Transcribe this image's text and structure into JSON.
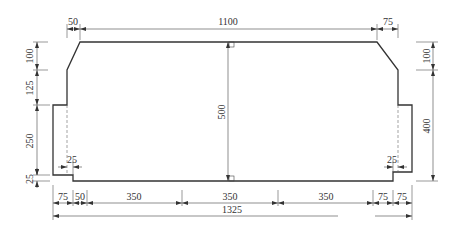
{
  "drawing": {
    "title": "Cross-section dimension drawing",
    "units": "mm",
    "top_dimensions": {
      "left_offset": "50",
      "top_width": "1100",
      "right_offset": "75"
    },
    "left_dimensions": {
      "upper_slope_height": "100",
      "middle_height": "125",
      "lower_height": "250",
      "bottom_step": "25"
    },
    "right_dimensions": {
      "upper_slope_height": "100",
      "lower_height": "400"
    },
    "center_dimension": {
      "total_height": "500"
    },
    "inner_dimensions": {
      "left_step": "25",
      "right_step": "25"
    },
    "bottom_dimensions": [
      "75",
      "50",
      "350",
      "350",
      "350",
      "75",
      "75"
    ],
    "overall_width": "1325"
  }
}
